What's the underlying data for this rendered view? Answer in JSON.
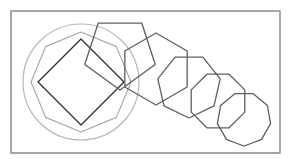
{
  "diagram": {
    "frame": {
      "x": 11,
      "y": 11,
      "width": 269,
      "height": 142,
      "stroke": "#8a8a8a",
      "stroke_width": 1.5
    },
    "circle": {
      "cx": 81,
      "cy": 82,
      "r": 58,
      "stroke": "#b8b8b8",
      "stroke_width": 1.2
    },
    "inscribed_octagon": {
      "sides": 8,
      "cx": 81,
      "cy": 82,
      "r": 50,
      "rotation_deg": -90,
      "stroke": "#a8a8a8",
      "stroke_width": 1.2
    },
    "square": {
      "sides": 4,
      "cx": 81,
      "cy": 82,
      "r": 43,
      "rotation_deg": -90,
      "stroke": "#333333",
      "stroke_width": 1.4
    },
    "polygon_chain": [
      {
        "name": "pentagon",
        "sides": 5,
        "cx": 120,
        "cy": 53,
        "r": 37,
        "rotation_deg": -126,
        "stroke": "#5f5f5f",
        "stroke_width": 1.3
      },
      {
        "name": "hexagon",
        "sides": 6,
        "cx": 156,
        "cy": 69,
        "r": 36,
        "rotation_deg": -90,
        "stroke": "#5f5f5f",
        "stroke_width": 1.3
      },
      {
        "name": "heptagon",
        "sides": 7,
        "cx": 189,
        "cy": 86,
        "r": 32,
        "rotation_deg": -115.7,
        "stroke": "#5f5f5f",
        "stroke_width": 1.3
      },
      {
        "name": "octagon",
        "sides": 8,
        "cx": 218,
        "cy": 101,
        "r": 29,
        "rotation_deg": -112.5,
        "stroke": "#5f5f5f",
        "stroke_width": 1.3
      },
      {
        "name": "nonagon",
        "sides": 9,
        "cx": 244,
        "cy": 119,
        "r": 27,
        "rotation_deg": -110,
        "stroke": "#5f5f5f",
        "stroke_width": 1.3
      }
    ]
  }
}
